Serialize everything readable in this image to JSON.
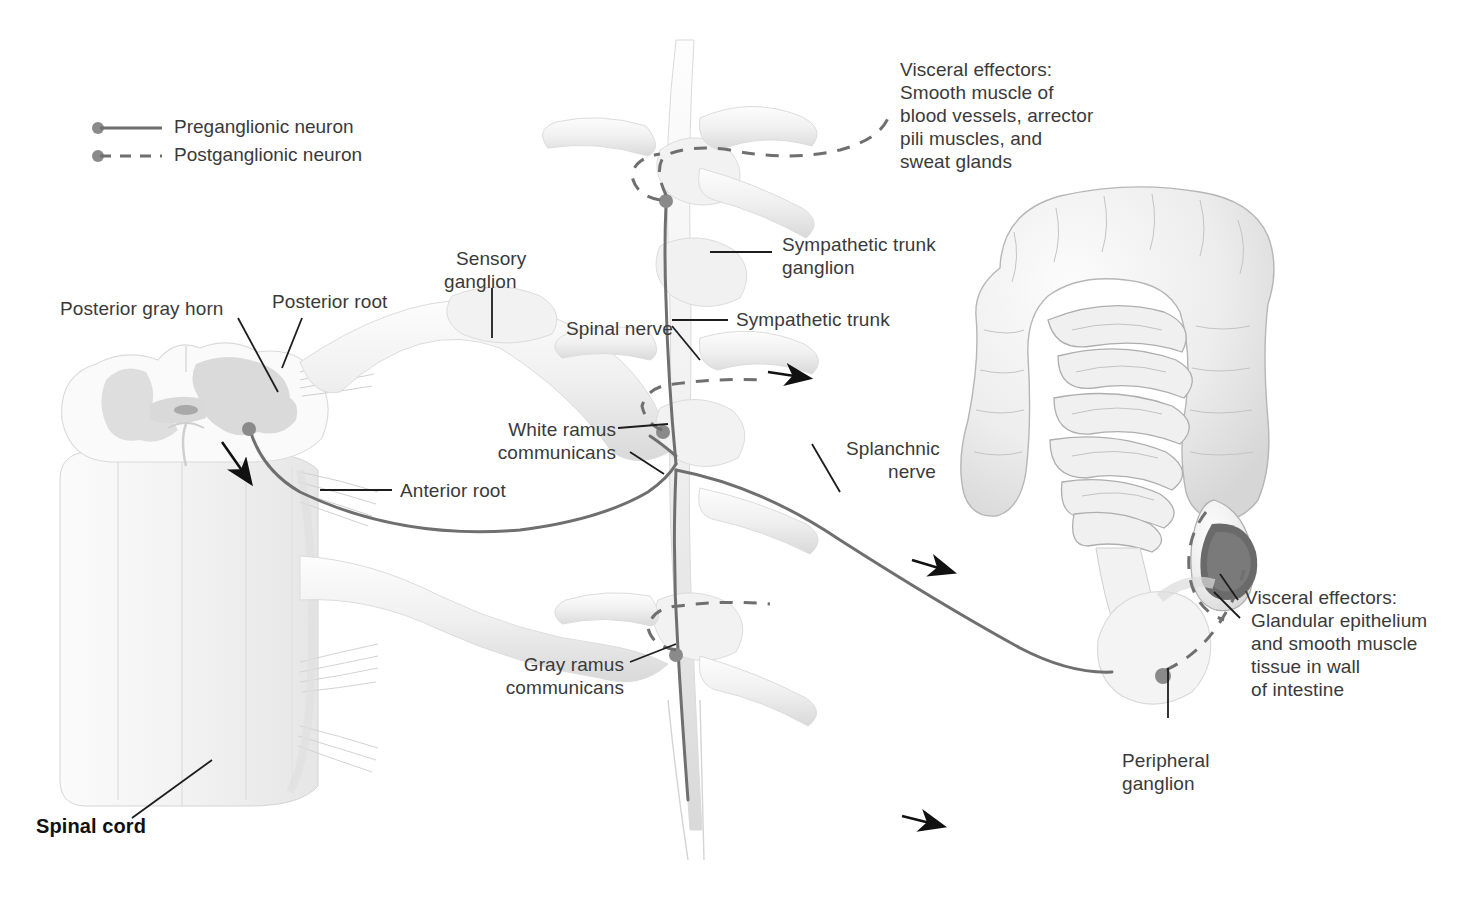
{
  "figure": {
    "background": "#ffffff",
    "nerve_color": "#6f6f6f",
    "text_color": "#3a3a3a",
    "arrow_color": "#111111",
    "tissue_color": "#e9e9e9"
  },
  "legend": {
    "items": [
      {
        "label": "Preganglionic neuron",
        "style": "solid",
        "color": "#6f6f6f"
      },
      {
        "label": "Postganglionic neuron",
        "style": "dashed",
        "color": "#6f6f6f"
      }
    ]
  },
  "labels": {
    "posterior_gray_horn": "Posterior gray horn",
    "posterior_root": "Posterior root",
    "sensory_ganglion_l1": "Sensory",
    "sensory_ganglion_l2": "ganglion",
    "spinal_nerve": "Spinal nerve",
    "sympathetic_trunk_ganglion_l1": "Sympathetic trunk",
    "sympathetic_trunk_ganglion_l2": "ganglion",
    "sympathetic_trunk": "Sympathetic trunk",
    "white_ramus_l1": "White ramus",
    "white_ramus_l2": "communicans",
    "anterior_root": "Anterior root",
    "gray_ramus_l1": "Gray ramus",
    "gray_ramus_l2": "communicans",
    "splanchnic_l1": "Splanchnic",
    "splanchnic_l2": "nerve",
    "peripheral_ganglion_l1": "Peripheral",
    "peripheral_ganglion_l2": "ganglion",
    "spinal_cord": "Spinal cord",
    "visceral_top": [
      "Visceral effectors:",
      "Smooth muscle of",
      "blood vessels, arrector",
      "pili muscles, and",
      "sweat glands"
    ],
    "visceral_bottom": [
      "Visceral effectors:",
      "Glandular epithelium",
      "and smooth muscle",
      "tissue in wall",
      "of intestine"
    ]
  }
}
